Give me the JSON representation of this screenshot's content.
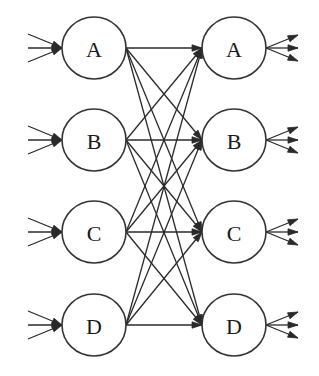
{
  "diagram": {
    "type": "bipartite-network",
    "left_nodes": [
      {
        "id": "left-A",
        "label": "A",
        "cx": 94,
        "cy": 48
      },
      {
        "id": "left-B",
        "label": "B",
        "cx": 94,
        "cy": 140
      },
      {
        "id": "left-C",
        "label": "C",
        "cx": 94,
        "cy": 232
      },
      {
        "id": "left-D",
        "label": "D",
        "cx": 94,
        "cy": 325
      }
    ],
    "right_nodes": [
      {
        "id": "right-A",
        "label": "A",
        "cx": 234,
        "cy": 48
      },
      {
        "id": "right-B",
        "label": "B",
        "cx": 234,
        "cy": 140
      },
      {
        "id": "right-C",
        "label": "C",
        "cx": 234,
        "cy": 232
      },
      {
        "id": "right-D",
        "label": "D",
        "cx": 234,
        "cy": 325
      }
    ],
    "node_radius_x": 32,
    "node_radius_y": 31,
    "incoming_stubs_per_left_node": 3,
    "outgoing_stubs_per_right_node": 3,
    "edges": "all-to-all (16 directed edges left to right)",
    "colors": {
      "stroke": "#333333",
      "background": "#ffffff"
    }
  }
}
